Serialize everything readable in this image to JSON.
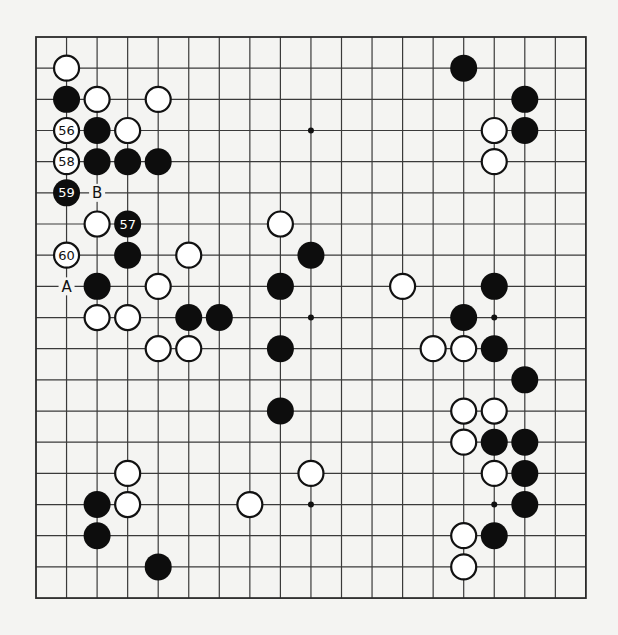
{
  "board": {
    "size": 19,
    "origin_x": 36,
    "origin_y": 37,
    "spacing_x": 30.55,
    "spacing_y": 31.17,
    "stone_radius": 13.5,
    "colors": {
      "background": "#f4f4f2",
      "line": "#3a3a3a",
      "black_stone": "#0d0d0d",
      "white_stone": "#ffffff"
    },
    "star_points": [
      [
        3,
        3
      ],
      [
        9,
        3
      ],
      [
        15,
        3
      ],
      [
        3,
        9
      ],
      [
        9,
        9
      ],
      [
        15,
        9
      ],
      [
        3,
        15
      ],
      [
        9,
        15
      ],
      [
        15,
        15
      ]
    ],
    "stones": [
      {
        "color": "white",
        "col": 1,
        "row": 1
      },
      {
        "color": "black",
        "col": 1,
        "row": 2
      },
      {
        "color": "white",
        "col": 2,
        "row": 2
      },
      {
        "color": "white",
        "col": 4,
        "row": 2
      },
      {
        "color": "white",
        "col": 1,
        "row": 3,
        "label": "56"
      },
      {
        "color": "black",
        "col": 2,
        "row": 3
      },
      {
        "color": "white",
        "col": 3,
        "row": 3
      },
      {
        "color": "white",
        "col": 1,
        "row": 4,
        "label": "58"
      },
      {
        "color": "black",
        "col": 2,
        "row": 4
      },
      {
        "color": "black",
        "col": 3,
        "row": 4
      },
      {
        "color": "black",
        "col": 4,
        "row": 4
      },
      {
        "color": "black",
        "col": 1,
        "row": 5,
        "label": "59"
      },
      {
        "color": "white",
        "col": 2,
        "row": 6
      },
      {
        "color": "black",
        "col": 3,
        "row": 6,
        "label": "57"
      },
      {
        "color": "white",
        "col": 8,
        "row": 6
      },
      {
        "color": "white",
        "col": 1,
        "row": 7,
        "label": "60"
      },
      {
        "color": "black",
        "col": 3,
        "row": 7
      },
      {
        "color": "white",
        "col": 5,
        "row": 7
      },
      {
        "color": "black",
        "col": 9,
        "row": 7
      },
      {
        "color": "black",
        "col": 2,
        "row": 8
      },
      {
        "color": "white",
        "col": 4,
        "row": 8
      },
      {
        "color": "black",
        "col": 8,
        "row": 8
      },
      {
        "color": "white",
        "col": 12,
        "row": 8
      },
      {
        "color": "white",
        "col": 2,
        "row": 9
      },
      {
        "color": "white",
        "col": 3,
        "row": 9
      },
      {
        "color": "black",
        "col": 5,
        "row": 9
      },
      {
        "color": "black",
        "col": 6,
        "row": 9
      },
      {
        "color": "white",
        "col": 4,
        "row": 10
      },
      {
        "color": "white",
        "col": 5,
        "row": 10
      },
      {
        "color": "black",
        "col": 8,
        "row": 10
      },
      {
        "color": "black",
        "col": 8,
        "row": 12
      },
      {
        "color": "black",
        "col": 14,
        "row": 1
      },
      {
        "color": "black",
        "col": 16,
        "row": 2
      },
      {
        "color": "white",
        "col": 15,
        "row": 3
      },
      {
        "color": "black",
        "col": 16,
        "row": 3
      },
      {
        "color": "white",
        "col": 15,
        "row": 4
      },
      {
        "color": "black",
        "col": 15,
        "row": 8
      },
      {
        "color": "black",
        "col": 14,
        "row": 9
      },
      {
        "color": "white",
        "col": 13,
        "row": 10
      },
      {
        "color": "white",
        "col": 14,
        "row": 10
      },
      {
        "color": "black",
        "col": 15,
        "row": 10
      },
      {
        "color": "black",
        "col": 16,
        "row": 11
      },
      {
        "color": "white",
        "col": 14,
        "row": 12
      },
      {
        "color": "white",
        "col": 15,
        "row": 12
      },
      {
        "color": "white",
        "col": 14,
        "row": 13
      },
      {
        "color": "black",
        "col": 15,
        "row": 13
      },
      {
        "color": "black",
        "col": 16,
        "row": 13
      },
      {
        "color": "white",
        "col": 15,
        "row": 14
      },
      {
        "color": "black",
        "col": 16,
        "row": 14
      },
      {
        "color": "black",
        "col": 16,
        "row": 15
      },
      {
        "color": "white",
        "col": 14,
        "row": 16
      },
      {
        "color": "black",
        "col": 15,
        "row": 16
      },
      {
        "color": "white",
        "col": 14,
        "row": 17
      },
      {
        "color": "white",
        "col": 3,
        "row": 14
      },
      {
        "color": "white",
        "col": 9,
        "row": 14
      },
      {
        "color": "black",
        "col": 2,
        "row": 15
      },
      {
        "color": "white",
        "col": 3,
        "row": 15
      },
      {
        "color": "white",
        "col": 7,
        "row": 15
      },
      {
        "color": "black",
        "col": 2,
        "row": 16
      },
      {
        "color": "black",
        "col": 4,
        "row": 17
      }
    ],
    "marks": [
      {
        "text": "A",
        "col": 1,
        "row": 8
      },
      {
        "text": "B",
        "col": 2,
        "row": 5
      }
    ]
  }
}
